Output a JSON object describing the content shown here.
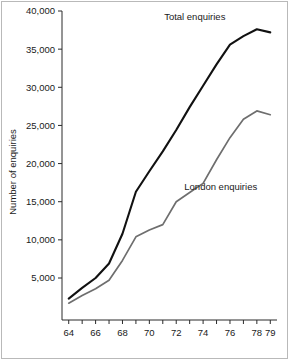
{
  "figure": {
    "background_color": "#ffffff",
    "border_color": "#b9b9b9"
  },
  "chart_data": {
    "type": "line",
    "title": "",
    "subtitle": "",
    "xlabel": "",
    "ylabel": "Number of enquiries",
    "x": [
      64,
      65,
      66,
      67,
      68,
      69,
      70,
      71,
      72,
      73,
      74,
      75,
      76,
      77,
      78,
      79
    ],
    "xlim": [
      63.5,
      79.5
    ],
    "ylim": [
      0,
      40000
    ],
    "xtick_values": [
      64,
      65,
      66,
      67,
      68,
      69,
      70,
      71,
      72,
      73,
      74,
      75,
      76,
      77,
      78,
      79
    ],
    "xtick_labels": [
      "64",
      "",
      "66",
      "",
      "68",
      "",
      "70",
      "",
      "72",
      "",
      "74",
      "",
      "76",
      "",
      "78",
      "79"
    ],
    "ytick_values": [
      5000,
      10000,
      15000,
      20000,
      25000,
      30000,
      35000,
      40000
    ],
    "ytick_labels": [
      "5,000",
      "10,000",
      "15,000",
      "20,000",
      "25,000",
      "30,000",
      "35,000",
      "40,000"
    ],
    "grid": false,
    "legend_position": "inline-annotation",
    "series": [
      {
        "name": "Total enquiries",
        "color": "#111111",
        "label_x": 71.1,
        "label_y": 38800,
        "values": [
          2300,
          3700,
          5000,
          6900,
          10800,
          16300,
          19000,
          21600,
          24400,
          27400,
          30200,
          33000,
          35600,
          36700,
          37600,
          37200
        ]
      },
      {
        "name": "London enquiries",
        "color": "#6e6e6e",
        "label_x": 72.6,
        "label_y": 16600,
        "values": [
          1700,
          2700,
          3600,
          4700,
          7300,
          10400,
          11300,
          12000,
          15000,
          16200,
          17400,
          20500,
          23400,
          25800,
          26900,
          26400
        ]
      }
    ],
    "annotations": [
      {
        "text": "Total enquiries",
        "series": "Total enquiries"
      },
      {
        "text": "London enquiries",
        "series": "London enquiries"
      }
    ]
  }
}
